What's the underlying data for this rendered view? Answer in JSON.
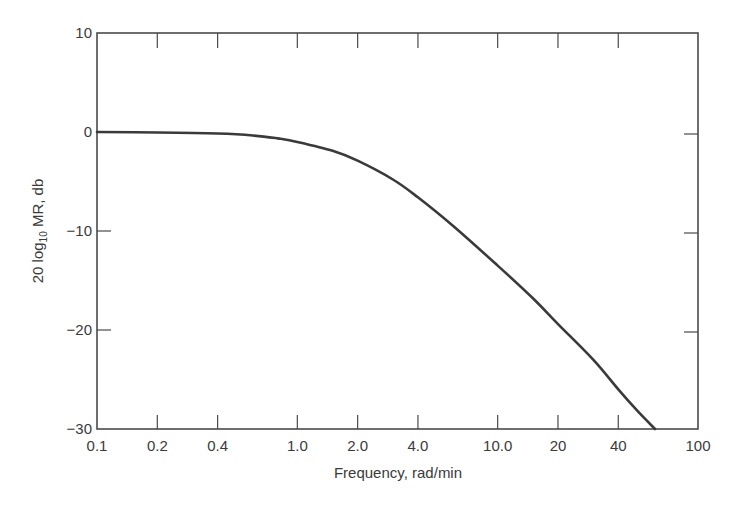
{
  "chart_data": {
    "type": "line",
    "title": "",
    "xlabel": "Frequency, rad/min",
    "ylabel": "20 log10 MR, db",
    "ylabel_parts": {
      "prefix": "20 log",
      "subscript": "10",
      "suffix": " MR, db"
    },
    "xscale": "log",
    "xlim": [
      0.1,
      100
    ],
    "ylim": [
      -30,
      10
    ],
    "grid": false,
    "legend": null,
    "x_ticks": [
      0.1,
      0.2,
      0.4,
      1.0,
      2.0,
      4.0,
      10.0,
      20,
      40,
      100
    ],
    "x_tick_labels": [
      "0.1",
      "0.2",
      "0.4",
      "1.0",
      "2.0",
      "4.0",
      "10.0",
      "20",
      "40",
      "100"
    ],
    "y_ticks": [
      10,
      0,
      -10,
      -20,
      -30
    ],
    "y_tick_labels": [
      "10",
      "0",
      "−10",
      "−20",
      "−30"
    ],
    "series": [
      {
        "name": "Magnitude ratio",
        "color": "#3a3a3a",
        "x": [
          0.1,
          0.2,
          0.4,
          0.6,
          0.8,
          1.0,
          1.5,
          2.0,
          3.0,
          4.0,
          6.0,
          10.0,
          15.0,
          20.0,
          30.0,
          40.0,
          50.0,
          61.0
        ],
        "y": [
          0.0,
          -0.05,
          -0.15,
          -0.35,
          -0.65,
          -1.0,
          -1.9,
          -2.9,
          -4.8,
          -6.6,
          -9.5,
          -13.5,
          -16.8,
          -19.4,
          -23.0,
          -26.0,
          -28.2,
          -30.0
        ]
      }
    ]
  }
}
